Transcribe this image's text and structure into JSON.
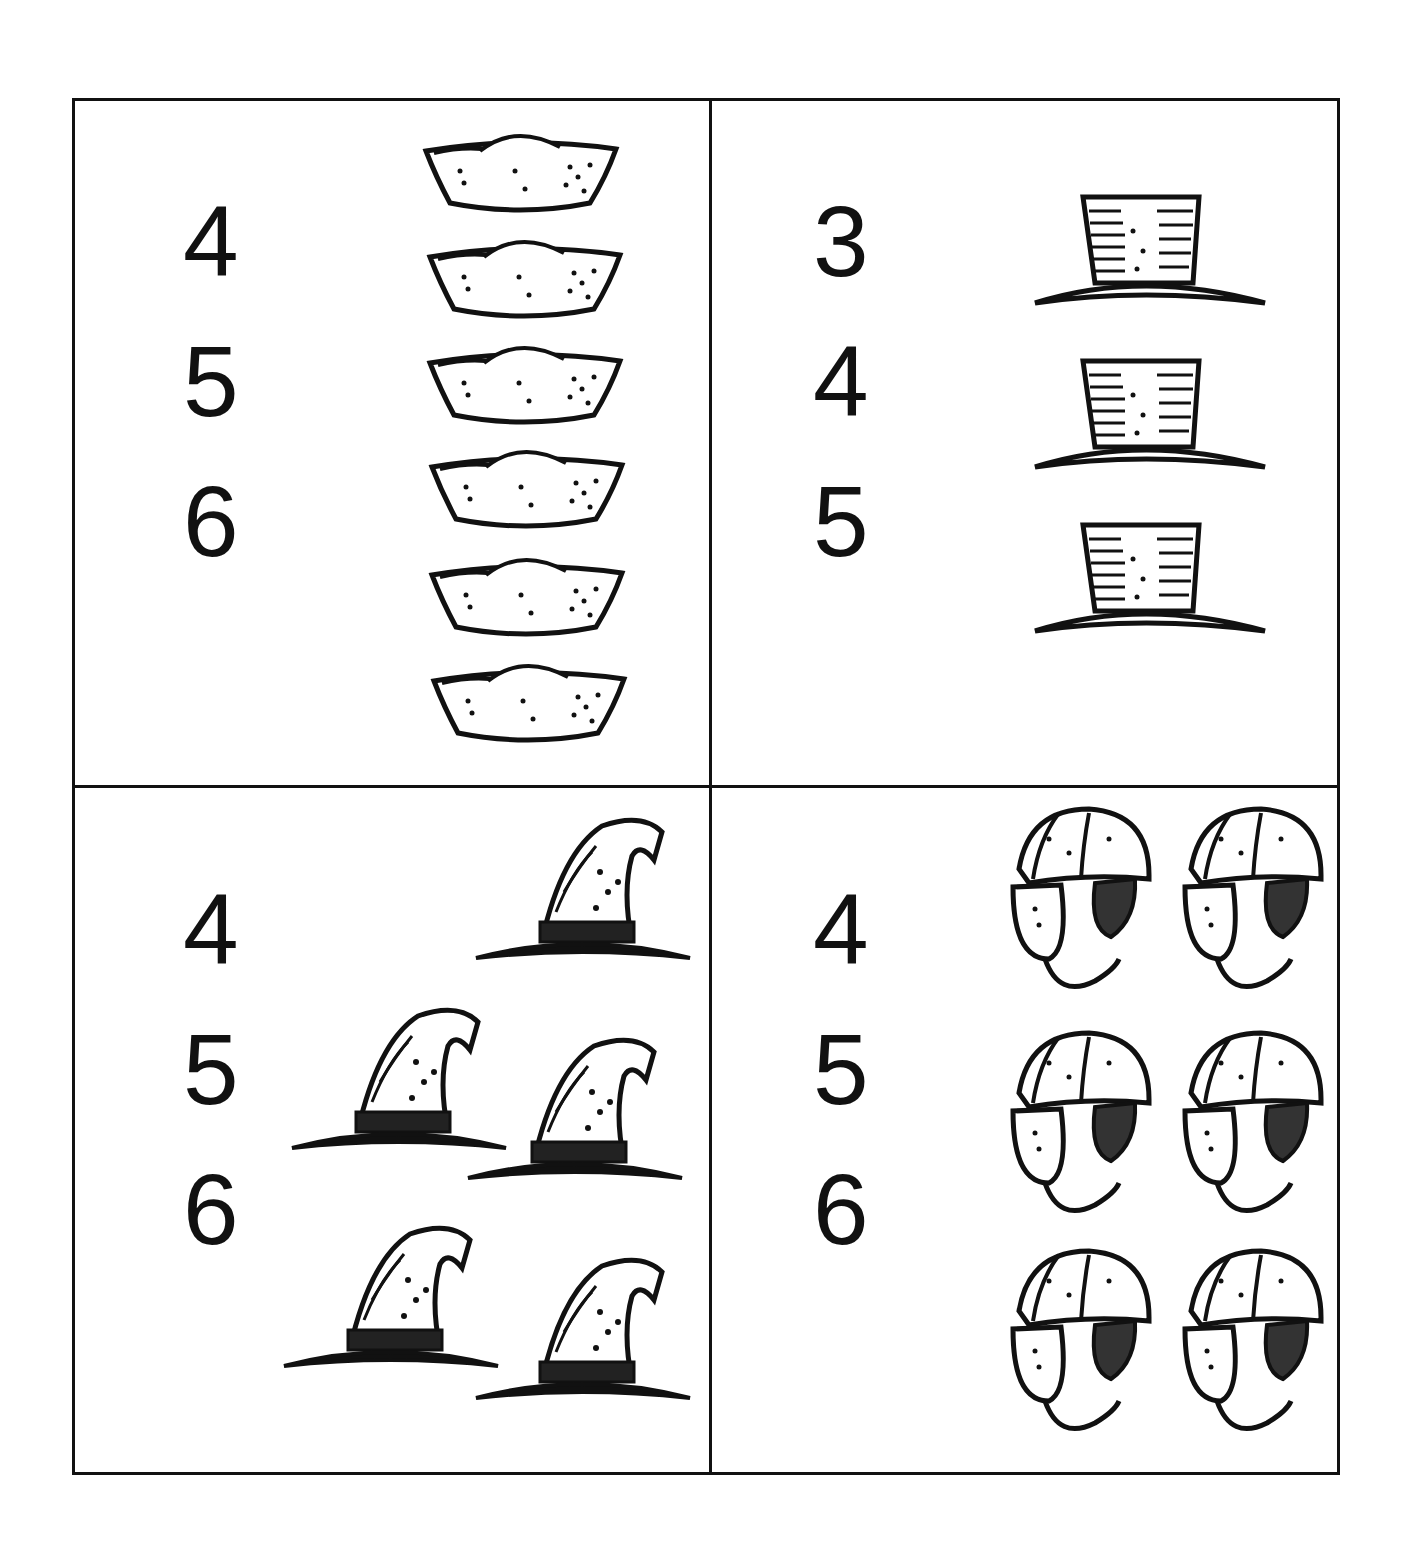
{
  "worksheet": {
    "instruction": "",
    "cells": [
      {
        "id": "sailor-hats",
        "object": "sailor hat",
        "choices": [
          "4",
          "5",
          "6"
        ],
        "picture_count": 6,
        "correct_answer": "6"
      },
      {
        "id": "top-hats",
        "object": "top hat",
        "choices": [
          "3",
          "4",
          "5"
        ],
        "picture_count": 3,
        "correct_answer": "3"
      },
      {
        "id": "witch-hats",
        "object": "witch hat",
        "choices": [
          "4",
          "5",
          "6"
        ],
        "picture_count": 5,
        "correct_answer": "5"
      },
      {
        "id": "aviator-caps",
        "object": "aviator cap",
        "choices": [
          "4",
          "5",
          "6"
        ],
        "picture_count": 6,
        "correct_answer": "6"
      }
    ]
  },
  "colors": {
    "ink": "#111111",
    "paper": "#ffffff"
  }
}
